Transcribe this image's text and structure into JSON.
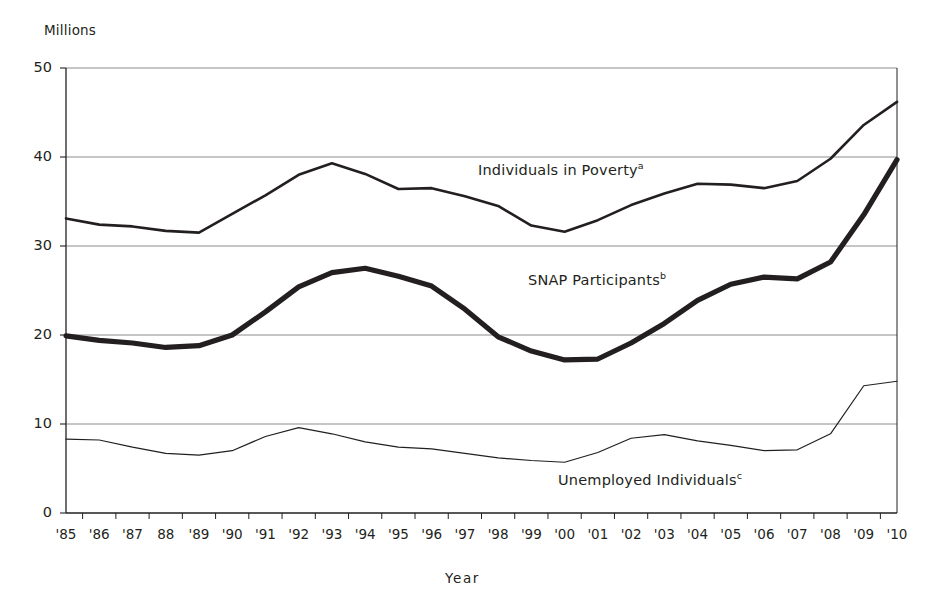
{
  "figure": {
    "yaxis_title": "Millions",
    "xaxis_title": "Year"
  },
  "labels": {
    "poverty": "Individuals in Poverty",
    "poverty_note": "a",
    "snap": "SNAP Participants",
    "snap_note": "b",
    "unemployed": "Unemployed Individuals",
    "unemployed_note": "c"
  },
  "colors": {
    "line": "#231f20",
    "grid": "#7f7f7f",
    "axis": "#231f20",
    "background": "#ffffff"
  },
  "chart_data": {
    "type": "line",
    "title": "",
    "xlabel": "Year",
    "ylabel": "Millions",
    "ylim": [
      0,
      50
    ],
    "yticks": [
      0,
      10,
      20,
      30,
      40,
      50
    ],
    "grid": true,
    "legend": "inline-annotations",
    "categories": [
      "'85",
      "'86",
      "'87",
      "88",
      "'89",
      "'90",
      "'91",
      "'92",
      "'93",
      "'94",
      "'95",
      "'96",
      "'97",
      "'98",
      "'99",
      "'00",
      "'01",
      "'02",
      "'03",
      "'04",
      "'05",
      "'06",
      "'07",
      "'08",
      "'09",
      "'10"
    ],
    "x": [
      1985,
      1986,
      1987,
      1988,
      1989,
      1990,
      1991,
      1992,
      1993,
      1994,
      1995,
      1996,
      1997,
      1998,
      1999,
      2000,
      2001,
      2002,
      2003,
      2004,
      2005,
      2006,
      2007,
      2008,
      2009,
      2010
    ],
    "series": [
      {
        "name": "Individuals in Poverty",
        "note": "a",
        "stroke_width": 2.6,
        "values": [
          33.1,
          32.4,
          32.2,
          31.7,
          31.5,
          33.6,
          35.7,
          38.0,
          39.3,
          38.1,
          36.4,
          36.5,
          35.6,
          34.5,
          32.3,
          31.6,
          32.9,
          34.6,
          35.9,
          37.0,
          36.9,
          36.5,
          37.3,
          39.8,
          43.6,
          46.2
        ]
      },
      {
        "name": "SNAP Participants",
        "note": "b",
        "stroke_width": 5.2,
        "values": [
          19.9,
          19.4,
          19.1,
          18.6,
          18.8,
          20.0,
          22.6,
          25.4,
          27.0,
          27.5,
          26.6,
          25.5,
          22.9,
          19.8,
          18.2,
          17.2,
          17.3,
          19.1,
          21.3,
          23.9,
          25.7,
          26.5,
          26.3,
          28.2,
          33.5,
          39.7
        ]
      },
      {
        "name": "Unemployed Individuals",
        "note": "c",
        "stroke_width": 1.2,
        "values": [
          8.3,
          8.2,
          7.4,
          6.7,
          6.5,
          7.0,
          8.6,
          9.6,
          8.9,
          8.0,
          7.4,
          7.2,
          6.7,
          6.2,
          5.9,
          5.7,
          6.8,
          8.4,
          8.8,
          8.1,
          7.6,
          7.0,
          7.1,
          8.9,
          14.3,
          14.8
        ]
      }
    ]
  }
}
